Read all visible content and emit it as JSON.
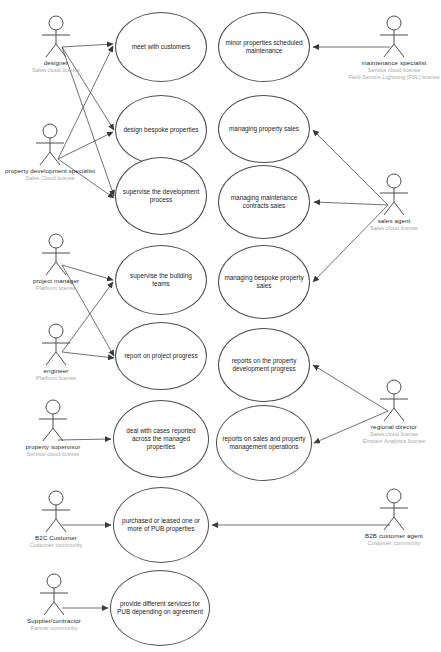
{
  "diagram": {
    "line_color": "#4d4d4d",
    "label_color": "#2b2b2b",
    "license_color": "#a8a8a8"
  },
  "actors": [
    {
      "id": "designer",
      "name": "designer",
      "license": "Sales cloud license",
      "x": 10,
      "y": 14,
      "side": "left"
    },
    {
      "id": "property-development-specialist",
      "name": "property development specialist",
      "license": "Sales Cloud license",
      "x": 4,
      "y": 122,
      "side": "left"
    },
    {
      "id": "project-manager",
      "name": "project manager",
      "license": "Platform license",
      "x": 10,
      "y": 232,
      "side": "left"
    },
    {
      "id": "engineer",
      "name": "engineer",
      "license": "Platform license",
      "x": 10,
      "y": 322,
      "side": "left"
    },
    {
      "id": "property-supervisor",
      "name": "property supervisor",
      "license": "Service cloud license",
      "x": 7,
      "y": 398,
      "side": "left"
    },
    {
      "id": "b2c-customer",
      "name": "B2C Customer",
      "license": "Customer community",
      "x": 10,
      "y": 489,
      "side": "left"
    },
    {
      "id": "supplier-contractor",
      "name": "Supplier/contractor",
      "license": "Partner community",
      "x": 8,
      "y": 572,
      "side": "left"
    },
    {
      "id": "maintenance-specialist",
      "name": "maintenance specialist",
      "license": "Service cloud license\nField Service Lightning (FSL) license",
      "x": 348,
      "y": 14,
      "side": "right"
    },
    {
      "id": "sales-agent",
      "name": "sales agent",
      "license": "Sales cloud license",
      "x": 348,
      "y": 172,
      "side": "right"
    },
    {
      "id": "regional-director",
      "name": "regional director",
      "license": "Sales cloud license\nEinstein Analytics license",
      "x": 348,
      "y": 378,
      "side": "right"
    },
    {
      "id": "b2b-customer-agent",
      "name": "B2B customer agent",
      "license": "Customer community",
      "x": 348,
      "y": 487,
      "side": "right"
    },
    {
      "id": "regional-director-spacer",
      "name": "",
      "license": "",
      "x": 0,
      "y": 0,
      "side": "none"
    }
  ],
  "use_cases": [
    {
      "id": "meet-with-customers",
      "label": "meet with customers",
      "x": 115,
      "y": 12,
      "w": 92,
      "h": 70
    },
    {
      "id": "design-bespoke-properties",
      "label": "design bespoke properties",
      "x": 115,
      "y": 95,
      "w": 92,
      "h": 70
    },
    {
      "id": "supervise-the-development-process",
      "label": "supervise the development process",
      "x": 115,
      "y": 157,
      "w": 92,
      "h": 78
    },
    {
      "id": "supervise-the-building-teams",
      "label": "supervise the building teams",
      "x": 115,
      "y": 245,
      "w": 92,
      "h": 70
    },
    {
      "id": "report-on-project-progress",
      "label": "report on project progress",
      "x": 115,
      "y": 322,
      "w": 92,
      "h": 68
    },
    {
      "id": "deal-with-cases",
      "label": "deal with cases reported across the managed properties",
      "x": 113,
      "y": 400,
      "w": 96,
      "h": 78
    },
    {
      "id": "purchased-or-leased",
      "label": "purchased or leased one or more of PUB properties",
      "x": 113,
      "y": 487,
      "w": 96,
      "h": 76
    },
    {
      "id": "provide-different-services",
      "label": "provide different services for PUB depending on agreement",
      "x": 110,
      "y": 570,
      "w": 100,
      "h": 76
    },
    {
      "id": "minor-properties-scheduled-maintenance",
      "label": "minor properties scheduled maintenance",
      "x": 218,
      "y": 12,
      "w": 92,
      "h": 70
    },
    {
      "id": "managing-property-sales",
      "label": "managing property sales",
      "x": 218,
      "y": 95,
      "w": 92,
      "h": 68
    },
    {
      "id": "managing-maintenance-contracts-sales",
      "label": "managing maintenance contracts sales",
      "x": 218,
      "y": 165,
      "w": 92,
      "h": 74
    },
    {
      "id": "managing-bespoke-property-sales",
      "label": "managing bespoke property sales",
      "x": 218,
      "y": 245,
      "w": 92,
      "h": 74
    },
    {
      "id": "reports-on-the-property-development-progress",
      "label": "reports on the property development progress",
      "x": 218,
      "y": 328,
      "w": 92,
      "h": 74
    },
    {
      "id": "reports-on-sales-and-property-management-operations",
      "label": "reports on sales and property management operations",
      "x": 216,
      "y": 405,
      "w": 96,
      "h": 76
    }
  ],
  "associations": [
    {
      "from": "designer",
      "to": "meet-with-customers"
    },
    {
      "from": "designer",
      "to": "design-bespoke-properties"
    },
    {
      "from": "designer",
      "to": "supervise-the-development-process"
    },
    {
      "from": "property-development-specialist",
      "to": "meet-with-customers"
    },
    {
      "from": "property-development-specialist",
      "to": "design-bespoke-properties"
    },
    {
      "from": "property-development-specialist",
      "to": "supervise-the-development-process"
    },
    {
      "from": "project-manager",
      "to": "supervise-the-building-teams"
    },
    {
      "from": "project-manager",
      "to": "report-on-project-progress"
    },
    {
      "from": "engineer",
      "to": "supervise-the-building-teams"
    },
    {
      "from": "engineer",
      "to": "report-on-project-progress"
    },
    {
      "from": "property-supervisor",
      "to": "deal-with-cases"
    },
    {
      "from": "b2c-customer",
      "to": "purchased-or-leased"
    },
    {
      "from": "supplier-contractor",
      "to": "provide-different-services"
    },
    {
      "from": "maintenance-specialist",
      "to": "minor-properties-scheduled-maintenance"
    },
    {
      "from": "sales-agent",
      "to": "managing-property-sales"
    },
    {
      "from": "sales-agent",
      "to": "managing-maintenance-contracts-sales"
    },
    {
      "from": "sales-agent",
      "to": "managing-bespoke-property-sales"
    },
    {
      "from": "regional-director",
      "to": "reports-on-the-property-development-progress"
    },
    {
      "from": "regional-director",
      "to": "reports-on-sales-and-property-management-operations"
    },
    {
      "from": "b2b-customer-agent",
      "to": "purchased-or-leased"
    }
  ]
}
